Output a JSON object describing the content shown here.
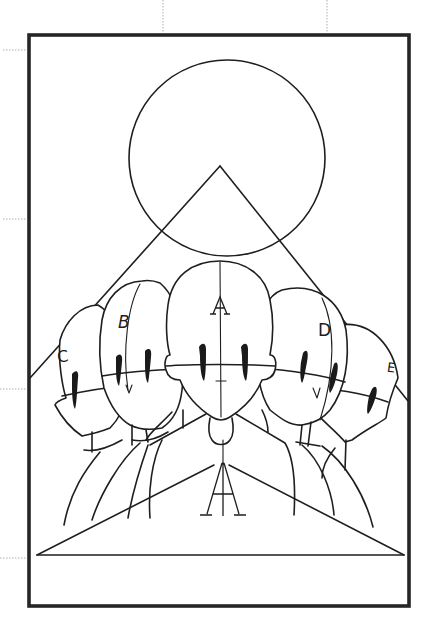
{
  "figure": {
    "labels": {
      "center_head": "A",
      "left_head_1": "B",
      "left_head_2": "C",
      "right_head_1": "D",
      "right_head_2": "E",
      "bottom_mark": "A"
    },
    "colors": {
      "line": "#1e1e1e",
      "frame": "#262626",
      "background": "#ffffff",
      "guide": "#9a9a9a"
    },
    "geometry": {
      "frame": {
        "x": 28,
        "y": 34,
        "width": 381,
        "height": 572
      },
      "circle": {
        "cx": 227,
        "cy": 158,
        "r": 98
      },
      "upper_triangle_apex": [
        220,
        166
      ],
      "lower_triangle": {
        "apex": [
          220,
          462
        ],
        "base_left": [
          37,
          555
        ],
        "base_right": [
          404,
          555
        ]
      }
    }
  }
}
